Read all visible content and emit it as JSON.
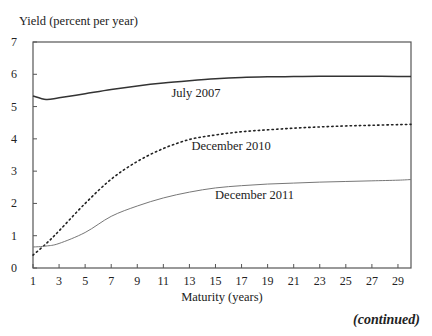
{
  "chart_data": {
    "type": "line",
    "title": "",
    "ylabel": "Yield (percent per year)",
    "xlabel": "Maturity (years)",
    "xlim": [
      1,
      30
    ],
    "ylim": [
      0,
      7
    ],
    "xticks": [
      1,
      3,
      5,
      7,
      9,
      11,
      13,
      15,
      17,
      19,
      21,
      23,
      25,
      27,
      29
    ],
    "yticks": [
      0,
      1,
      2,
      3,
      4,
      5,
      6,
      7
    ],
    "grid": false,
    "legend": "inline labels",
    "x": [
      1,
      2,
      3,
      5,
      7,
      9,
      11,
      13,
      15,
      17,
      19,
      21,
      23,
      25,
      27,
      29,
      30
    ],
    "series": [
      {
        "name": "July 2007",
        "style": "solid",
        "values": [
          5.33,
          5.22,
          5.27,
          5.4,
          5.53,
          5.64,
          5.73,
          5.8,
          5.86,
          5.9,
          5.92,
          5.93,
          5.94,
          5.94,
          5.94,
          5.93,
          5.93
        ]
      },
      {
        "name": "December 2010",
        "style": "dotted",
        "values": [
          0.4,
          0.75,
          1.15,
          2.0,
          2.75,
          3.3,
          3.7,
          3.98,
          4.12,
          4.22,
          4.28,
          4.33,
          4.37,
          4.4,
          4.42,
          4.44,
          4.45
        ]
      },
      {
        "name": "December 2011",
        "style": "solid-thin",
        "values": [
          0.65,
          0.68,
          0.76,
          1.1,
          1.6,
          1.92,
          2.17,
          2.35,
          2.48,
          2.55,
          2.6,
          2.63,
          2.66,
          2.68,
          2.7,
          2.72,
          2.74
        ]
      }
    ],
    "annotations": [
      {
        "text": "July 2007",
        "x": 13.5,
        "y": 5.3
      },
      {
        "text": "December 2010",
        "x": 16.2,
        "y": 3.65
      },
      {
        "text": "December 2011",
        "x": 18.0,
        "y": 2.15
      }
    ]
  },
  "labels": {
    "y_axis_title": "Yield (percent per year)",
    "x_axis_title": "Maturity (years)",
    "footer": "(continued)",
    "series_labels": [
      "July 2007",
      "December 2010",
      "December 2011"
    ],
    "y_ticks": [
      "0",
      "1",
      "2",
      "3",
      "4",
      "5",
      "6",
      "7"
    ],
    "x_ticks": [
      "1",
      "3",
      "5",
      "7",
      "9",
      "11",
      "13",
      "15",
      "17",
      "19",
      "21",
      "23",
      "25",
      "27",
      "29"
    ]
  }
}
